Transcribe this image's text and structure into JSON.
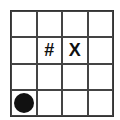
{
  "board": {
    "rows": 4,
    "cols": 4,
    "cells": [
      [
        "",
        "",
        "",
        ""
      ],
      [
        "",
        "#",
        "X",
        ""
      ],
      [
        "",
        "",
        "",
        ""
      ],
      [
        "●",
        "",
        "",
        ""
      ]
    ]
  },
  "pieces": [
    {
      "row": 3,
      "col": 0,
      "type": "black-circle"
    },
    {
      "row": 1,
      "col": 1,
      "type": "hash",
      "symbol": "#"
    },
    {
      "row": 1,
      "col": 2,
      "type": "x-mark",
      "symbol": "X"
    }
  ]
}
